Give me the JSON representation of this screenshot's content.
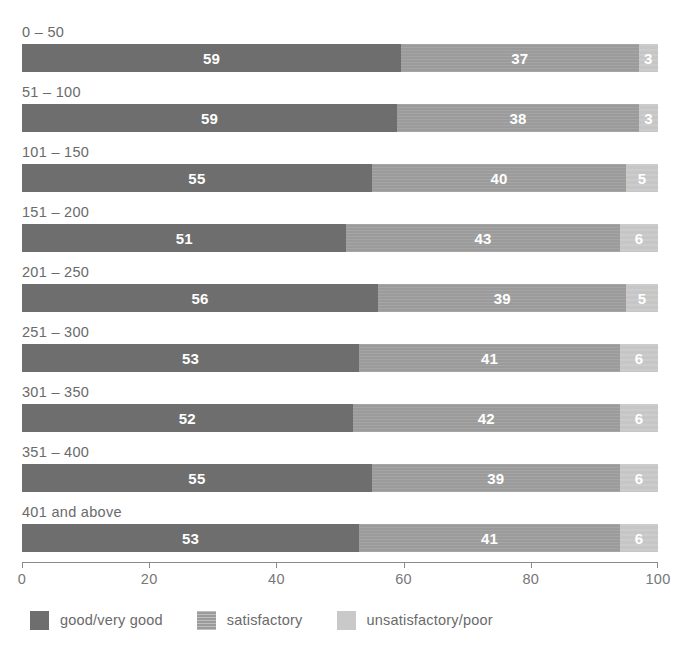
{
  "chart_data": {
    "type": "bar",
    "subtype": "horizontal-stacked-100",
    "title": "",
    "xlabel": "",
    "ylabel": "",
    "xlim": [
      0,
      100
    ],
    "xticks": [
      0,
      20,
      40,
      60,
      80,
      100
    ],
    "xticklabels": [
      "0",
      "20",
      "40",
      "60",
      "80",
      "100"
    ],
    "grid": false,
    "legend_position": "bottom-left",
    "categories": [
      "0 – 50",
      "51 – 100",
      "101 – 150",
      "151 – 200",
      "201 – 250",
      "251 – 300",
      "301 – 350",
      "351 – 400",
      "401 and above"
    ],
    "series": [
      {
        "name": "good/very good",
        "color": "#6e6e6e",
        "values": [
          59,
          59,
          55,
          51,
          56,
          53,
          52,
          55,
          53
        ]
      },
      {
        "name": "satisfactory",
        "color": "#9b9b9b",
        "values": [
          37,
          38,
          40,
          43,
          39,
          41,
          42,
          39,
          41
        ]
      },
      {
        "name": "unsatisfactory/poor",
        "color": "#c9c9c9",
        "values": [
          3,
          3,
          5,
          6,
          5,
          6,
          6,
          6,
          6
        ]
      }
    ]
  },
  "legend": {
    "items": [
      {
        "label": "good/very good",
        "color": "#6e6e6e",
        "texture": "solid"
      },
      {
        "label": "satisfactory",
        "color": "#9b9b9b",
        "texture": "lines"
      },
      {
        "label": "unsatisfactory/poor",
        "color": "#c9c9c9",
        "texture": "solid"
      }
    ]
  },
  "axis": {
    "line_color": "#8a8a8a",
    "label_color": "#777777"
  }
}
